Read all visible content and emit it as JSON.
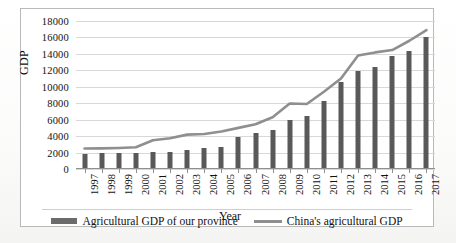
{
  "chart_data": {
    "type": "bar",
    "title": "",
    "xlabel": "Year",
    "ylabel": "GDP",
    "categories": [
      "1997",
      "1998",
      "1999",
      "2000",
      "2001",
      "2002",
      "2003",
      "2004",
      "2005",
      "2006",
      "2007",
      "2008",
      "2009",
      "2010",
      "2011",
      "2012",
      "2013",
      "2014",
      "2015",
      "2016",
      "2017"
    ],
    "ylim": [
      0,
      18000
    ],
    "ytick_step": 2000,
    "yticks": [
      "18000",
      "16000",
      "14000",
      "12000",
      "10000",
      "8000",
      "6000",
      "4000",
      "2000",
      "0"
    ],
    "ytick_values": [
      18000,
      16000,
      14000,
      12000,
      10000,
      8000,
      6000,
      4000,
      2000,
      0
    ],
    "grid": true,
    "legend_position": "bottom",
    "series": [
      {
        "name": "Agricultural GDP of our province",
        "render": "bar",
        "color": "#595959",
        "values": [
          1880,
          1890,
          1900,
          1960,
          2060,
          2100,
          2340,
          2530,
          2730,
          3930,
          4330,
          4790,
          5920,
          6440,
          8270,
          10580,
          11930,
          12370,
          13770,
          14300,
          16040
        ]
      },
      {
        "name": "China's agricultural GDP",
        "render": "line",
        "color": "#8f8f8f",
        "values": [
          2500,
          2510,
          2560,
          2640,
          3500,
          3740,
          4180,
          4250,
          4560,
          5000,
          5440,
          6300,
          7960,
          7900,
          9400,
          11000,
          13800,
          14180,
          14470,
          15600,
          16900
        ]
      }
    ]
  },
  "legend": {
    "items": [
      {
        "label": "Agricultural GDP of our province",
        "marker": "bar-swatch",
        "color": "#6b6b6b"
      },
      {
        "label": "China's agricultural GDP",
        "marker": "line-swatch",
        "color": "#8f8f8f"
      }
    ]
  },
  "axes": {
    "y_title": "GDP",
    "x_title": "Year"
  }
}
